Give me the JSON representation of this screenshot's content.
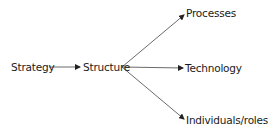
{
  "diagram": {
    "type": "flow",
    "nodes": {
      "strategy": "Strategy",
      "structure": "Structure",
      "processes": "Processes",
      "technology": "Technology",
      "individuals": "Individuals/roles"
    },
    "edges": [
      {
        "from": "Strategy",
        "to": "Structure"
      },
      {
        "from": "Structure",
        "to": "Processes"
      },
      {
        "from": "Structure",
        "to": "Technology"
      },
      {
        "from": "Structure",
        "to": "Individuals/roles"
      }
    ],
    "line_color": "#333333"
  }
}
